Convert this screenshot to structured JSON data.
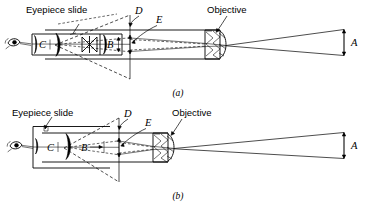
{
  "figure": {
    "background_color": "#ffffff",
    "line_color": "#000000"
  },
  "panels": [
    {
      "id": "panel-a",
      "caption": "(a)",
      "labels": {
        "eyepiece_slide": "Eyepiece slide",
        "objective": "Objective",
        "d": "D",
        "e": "E",
        "a": "A",
        "b": "B",
        "c": "C"
      }
    },
    {
      "id": "panel-b",
      "caption": "(b)",
      "labels": {
        "eyepiece_slide": "Eyepiece slide",
        "objective": "Objective",
        "d": "D",
        "e": "E",
        "a": "A",
        "b": "B",
        "c": "C"
      }
    }
  ],
  "icons": {
    "eye": "eye-icon",
    "objective_lens": "hatched-lens-icon",
    "eye_lens": "eye-lens-icon",
    "field_lens": "field-lens-icon",
    "arrow_double_vertical": "double-arrow-vertical-icon",
    "arrow_right": "arrow-right-icon"
  }
}
